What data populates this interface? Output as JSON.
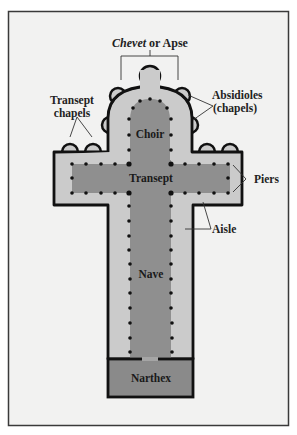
{
  "figure": {
    "colors": {
      "frame_bg": "#f2f2f1",
      "frame_border": "#3a3a3a",
      "aisle_fill": "#cbcbcb",
      "nave_fill": "#8f8f8f",
      "narthex_fill": "#8a8a8a",
      "wall": "#111111",
      "pier": "#111111",
      "text": "#222222"
    },
    "labels": {
      "chevet_italic": "Chevet",
      "chevet_rest": " or Apse",
      "absidioles_line1": "Absidioles",
      "absidioles_line2": "(chapels)",
      "transept_chapels_line1": "Transept",
      "transept_chapels_line2": "chapels",
      "choir": "Choir",
      "transept": "Transept",
      "piers": "Piers",
      "aisle": "Aisle",
      "nave": "Nave",
      "narthex": "Narthex"
    },
    "regions": [
      {
        "name": "Choir",
        "type": "inner space"
      },
      {
        "name": "Transept",
        "type": "crossing arm"
      },
      {
        "name": "Nave",
        "type": "central vessel"
      },
      {
        "name": "Aisle",
        "type": "side passage"
      },
      {
        "name": "Narthex",
        "type": "entrance vestibule"
      },
      {
        "name": "Absidioles (chapels)",
        "type": "radiating chapels"
      },
      {
        "name": "Transept chapels",
        "type": "chapels"
      },
      {
        "name": "Chevet or Apse",
        "type": "east end"
      },
      {
        "name": "Piers",
        "type": "supports"
      }
    ]
  }
}
